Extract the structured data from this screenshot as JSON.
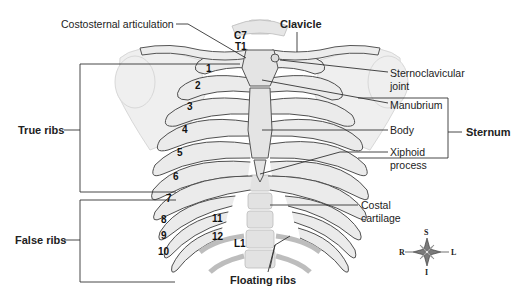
{
  "figure": {
    "colors": {
      "bone": "#e9e9e9",
      "bone_outline": "#555555",
      "cartilage": "#d4d4d4",
      "shoulder": "#ececec",
      "leader_lines": "#333333",
      "background": "#ffffff"
    }
  },
  "labels": {
    "costosternal_articulation": "Costosternal articulation",
    "clavicle": "Clavicle",
    "c7": "C7",
    "t1": "T1",
    "sternoclavicular_joint_line1": "Sternoclavicular",
    "sternoclavicular_joint_line2": "joint",
    "manubrium": "Manubrium",
    "body": "Body",
    "xiphoid_line1": "Xiphoid",
    "xiphoid_line2": "process",
    "sternum": "Sternum",
    "true_ribs": "True ribs",
    "false_ribs": "False ribs",
    "floating_ribs": "Floating ribs",
    "costal_cartilage_line1": "Costal",
    "costal_cartilage_line2": "cartilage",
    "l1": "L1"
  },
  "rib_numbers": [
    "1",
    "2",
    "3",
    "4",
    "5",
    "6",
    "7",
    "8",
    "9",
    "10",
    "11",
    "12"
  ],
  "compass": {
    "superior": "S",
    "inferior": "I",
    "right": "R",
    "left": "L"
  }
}
